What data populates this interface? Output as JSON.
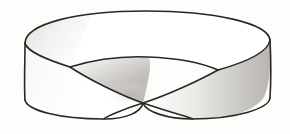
{
  "figure": {
    "name": "mobius-strip",
    "alt_text": "Line drawing of a Mobius band: a flat ring with a single half-twist, the near edge crossing itself at the centre bottom.",
    "render_style": "scanned ink line drawing with grey gradient shading",
    "background_color": "#fdfdfc",
    "stroke_color": "#2a2724",
    "stroke_width": 1.6,
    "surface_fill": "#ffffff",
    "shade_light": "#f2f1ef",
    "shade_mid": "#cfcdca",
    "shade_dark": "#a9a6a2",
    "width": 290,
    "height": 134
  },
  "geometry": {
    "outer_rim_top_y": 11,
    "inner_rim_apex_y": 58,
    "left_edge_x": 25,
    "right_edge_x": 270,
    "left_edge_top_y": 43,
    "left_edge_bottom_y": 102,
    "right_edge_top_y": 38,
    "right_edge_bottom_y": 100,
    "crossing_point": [
      143,
      103
    ],
    "left_fork_point": [
      70,
      67
    ],
    "right_fork_point": [
      218,
      70
    ],
    "bottom_arc_low_y": 119,
    "band_center": [
      147,
      67
    ]
  },
  "paths": {
    "outer_rim": "M 25,43 C 26,24 75,11 146,11 C 214,11 268,23 270,40 C 271,56 216,70 146,70 C 76,70 24,58 25,43 Z",
    "inner_rim_front": "M 70,67 C 96,59 124,56 148,57 C 176,58 202,63 218,70",
    "left_outer_wall": "M 25,43 C 25,62 24,84 32,99 C 42,114 75,120 104,119",
    "right_outer_wall": "M 270,40 C 271,60 271,82 264,97 C 254,113 222,120 192,119",
    "bottom_left_arc": "M 25,100 C 27,110 58,119 104,119 C 127,119 141,112 143,103",
    "bottom_right_arc": "M 270,98 C 269,108 238,119 192,119 C 168,119 146,112 143,103",
    "twist_front_diagonal": "M 70,67 C 88,79 120,95 143,103 C 172,113 196,119 192,119",
    "twist_back_diagonal": "M 218,70 C 200,80 168,95 143,103 C 120,110 104,118 104,119",
    "left_edge_line": "M 25,43 L 25,100",
    "right_edge_line": "M 270,40 L 270,98"
  },
  "regions": [
    {
      "id": "top-band-surface",
      "label": "top band surface",
      "fill": "#ffffff",
      "note": "upper annular face seen from above"
    },
    {
      "id": "upper-left-shade",
      "label": "upper left inner shading",
      "fill": "#eeedeb",
      "note": "soft grey inside the top rim at the left"
    },
    {
      "id": "centre-twist-shade",
      "label": "centre twist shading",
      "fill": "#cfcdca",
      "note": "grey wedge where the band twists over near the crossing"
    },
    {
      "id": "right-outer-shade",
      "label": "right outer wall shading",
      "fill": "#d8d6d3",
      "note": "vertical grey gradient on the right outer face"
    },
    {
      "id": "left-outer-face",
      "label": "left outer wall",
      "fill": "#ffffff",
      "note": "outer face on the left, near white"
    }
  ],
  "annotations": {
    "has_labels": false,
    "has_axes": false,
    "has_legend": false,
    "has_caption": false,
    "label_texts": []
  }
}
